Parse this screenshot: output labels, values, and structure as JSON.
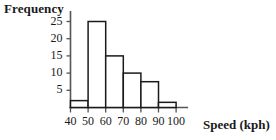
{
  "chart_data": {
    "type": "bar",
    "title": "",
    "xlabel": "Speed (kph)",
    "ylabel": "Frequency",
    "categories": [
      "40-50",
      "50-60",
      "60-70",
      "70-80",
      "80-90",
      "90-100"
    ],
    "bin_edges": [
      40,
      50,
      60,
      70,
      80,
      90,
      100
    ],
    "values": [
      2,
      25,
      15,
      10,
      7.5,
      1.5
    ],
    "x_tick_labels": [
      "40",
      "50",
      "60",
      "70",
      "80",
      "90",
      "100"
    ],
    "y_tick_labels": [
      "5",
      "10",
      "15",
      "20",
      "25"
    ],
    "y_tick_values": [
      5,
      10,
      15,
      20,
      25
    ],
    "xlim": [
      40,
      100
    ],
    "ylim": [
      0,
      27
    ],
    "grid": false,
    "legend": false,
    "bar_fill_color": "#ffffff",
    "bar_edge_color": "#1a1a1a",
    "axis_color": "#555555"
  },
  "axes": {
    "y_axis_title": "Frequency",
    "x_axis_title": "Speed (kph)"
  }
}
